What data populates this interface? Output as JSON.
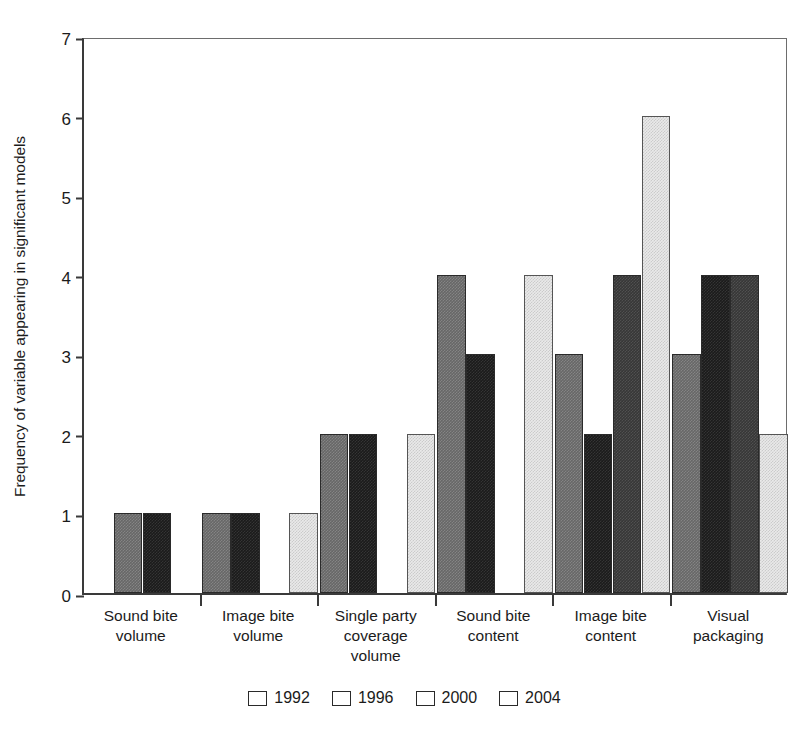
{
  "chart_data": {
    "type": "bar",
    "title": "",
    "xlabel": "",
    "ylabel": "Frequency of variable appearing in significant models",
    "ylim": [
      0,
      7
    ],
    "yticks": [
      "0",
      "1",
      "2",
      "3",
      "4",
      "5",
      "6",
      "7"
    ],
    "grid": false,
    "legend_position": "bottom-center",
    "categories": [
      "Sound bite\nvolume",
      "Image bite\nvolume",
      "Single party\ncoverage\nvolume",
      "Sound bite\ncontent",
      "Image bite\ncontent",
      "Visual\npackaging"
    ],
    "category_labels": [
      [
        "Sound bite",
        "volume"
      ],
      [
        "Image bite",
        "volume"
      ],
      [
        "Single party",
        "coverage",
        "volume"
      ],
      [
        "Sound bite",
        "content"
      ],
      [
        "Image bite",
        "content"
      ],
      [
        "Visual",
        "packaging"
      ]
    ],
    "series": [
      {
        "name": "1992",
        "color": "#676767",
        "values": [
          1,
          1,
          2,
          4,
          3,
          3
        ]
      },
      {
        "name": "1996",
        "color": "#1b1b1b",
        "values": [
          1,
          1,
          2,
          3,
          2,
          4
        ]
      },
      {
        "name": "2000",
        "color": "#373737",
        "values": [
          0,
          0,
          0,
          0,
          4,
          4
        ]
      },
      {
        "name": "2004",
        "color": "#e9e9e9",
        "values": [
          0,
          1,
          2,
          4,
          6,
          2
        ]
      }
    ]
  },
  "legend": {
    "items": [
      {
        "label": "1992"
      },
      {
        "label": "1996"
      },
      {
        "label": "2000"
      },
      {
        "label": "2004"
      }
    ]
  }
}
